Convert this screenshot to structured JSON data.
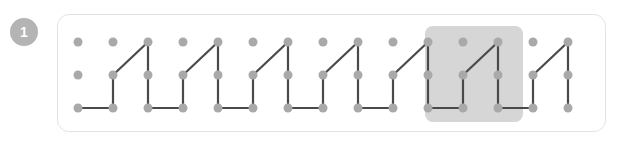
{
  "badge": {
    "label": "1",
    "color": "#b4b4b4",
    "text_color": "#ffffff"
  },
  "panel": {
    "x": 57,
    "y": 14,
    "width": 549,
    "height": 118,
    "border_color": "#e3e3e3",
    "background": "#ffffff",
    "radius": 12
  },
  "grid": {
    "cols": 15,
    "rows": 3,
    "x0": 78,
    "y0": 42,
    "col_spacing": 35,
    "row_spacing": 33,
    "dot_radius": 4.5,
    "dot_color": "#a9a9a9"
  },
  "highlight": {
    "x": 425,
    "y": 26,
    "width": 98,
    "height": 96,
    "color": "#d6d6d6",
    "radius": 8
  },
  "path": {
    "color": "#4a4a4a",
    "width": 2.2,
    "description": "zigzag sawtooth polyline over dot grid",
    "points": [
      [
        0,
        2
      ],
      [
        1,
        2
      ],
      [
        1,
        1
      ],
      [
        2,
        0
      ],
      [
        2,
        1
      ],
      [
        2,
        2
      ],
      [
        3,
        2
      ],
      [
        3,
        1
      ],
      [
        4,
        0
      ],
      [
        4,
        1
      ],
      [
        4,
        2
      ],
      [
        5,
        2
      ],
      [
        5,
        1
      ],
      [
        6,
        0
      ],
      [
        6,
        1
      ],
      [
        6,
        2
      ],
      [
        7,
        2
      ],
      [
        7,
        1
      ],
      [
        8,
        0
      ],
      [
        8,
        1
      ],
      [
        8,
        2
      ],
      [
        9,
        2
      ],
      [
        9,
        1
      ],
      [
        10,
        0
      ],
      [
        10,
        1
      ],
      [
        10,
        2
      ],
      [
        11,
        2
      ],
      [
        11,
        1
      ],
      [
        12,
        0
      ],
      [
        12,
        1
      ],
      [
        12,
        2
      ],
      [
        13,
        2
      ],
      [
        13,
        1
      ],
      [
        14,
        0
      ],
      [
        14,
        1
      ],
      [
        14,
        2
      ]
    ]
  },
  "chart_data": {
    "type": "line",
    "title": "",
    "xlabel": "",
    "ylabel": "",
    "categories": [
      "c0",
      "c1",
      "c2",
      "c3",
      "c4",
      "c5",
      "c6",
      "c7",
      "c8",
      "c9",
      "c10",
      "c11",
      "c12",
      "c13",
      "c14"
    ],
    "values": [
      2,
      2,
      0,
      2,
      0,
      2,
      0,
      2,
      0,
      2,
      0,
      2,
      0,
      2,
      0
    ],
    "ylim": [
      0,
      2
    ],
    "grid": true,
    "legend": "none"
  }
}
